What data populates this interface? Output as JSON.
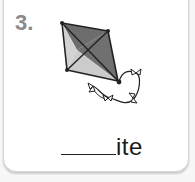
{
  "card": {
    "number": "3.",
    "picture": "kite-icon",
    "blank": "______",
    "word_suffix": "ite"
  },
  "colors": {
    "number": "#8a8a8a",
    "kite_dark": "#6a6a6a",
    "kite_light": "#cfcfcf",
    "outline": "#222222"
  }
}
